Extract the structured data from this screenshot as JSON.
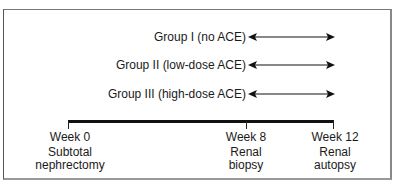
{
  "diagram": {
    "type": "study-timeline",
    "groups": [
      {
        "label": "Group I (no ACE)"
      },
      {
        "label": "Group II (low-dose ACE)"
      },
      {
        "label": "Group III (high-dose ACE)"
      }
    ],
    "timepoints": [
      {
        "label": "Week 0",
        "line1": "Subtotal",
        "line2": "nephrectomy"
      },
      {
        "label": "Week 8",
        "line1": "Renal",
        "line2": "biopsy"
      },
      {
        "label": "Week 12",
        "line1": "Renal",
        "line2": "autopsy"
      }
    ],
    "arrow_span": {
      "from": "Week 8",
      "to": "Week 12"
    },
    "colors": {
      "line": "#111111",
      "text": "#1a1a1a",
      "frame": "#777777"
    }
  }
}
